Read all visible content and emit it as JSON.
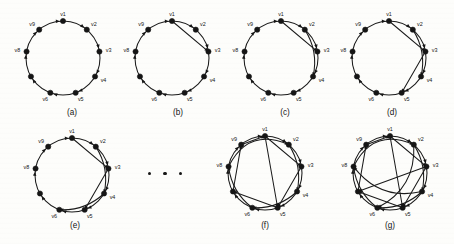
{
  "figure": {
    "background_color": "#fdfdfb",
    "ink_color": "#151515",
    "vertex_count": 9,
    "vertex_labels": [
      "v1",
      "v2",
      "v3",
      "v4",
      "v5",
      "v6",
      "v7",
      "v8",
      "v9"
    ],
    "visible_vertex_labels": [
      "v1",
      "v2",
      "v3",
      "v4",
      "v5",
      "v6",
      "v8",
      "v9"
    ],
    "ellipsis": {
      "name": "ellipsis-between-e-and-f",
      "dot_count": 3,
      "x": 148,
      "y": 172
    },
    "panels": [
      {
        "id": "a",
        "caption": "(a)",
        "caption_x": 72,
        "caption_y": 108,
        "cx": 63,
        "cy": 58,
        "r": 37,
        "chords": [],
        "outer_arcs": [],
        "labels_shown": [
          "v1",
          "v2",
          "v3",
          "v4",
          "v5",
          "v6",
          "v8",
          "v9"
        ]
      },
      {
        "id": "b",
        "caption": "(b)",
        "caption_x": 178,
        "caption_y": 108,
        "cx": 172,
        "cy": 58,
        "r": 37,
        "chords": [
          [
            1,
            3
          ]
        ],
        "outer_arcs": [],
        "labels_shown": [
          "v1",
          "v2",
          "v3",
          "v4",
          "v5",
          "v6",
          "v8",
          "v9"
        ]
      },
      {
        "id": "c",
        "caption": "(c)",
        "caption_x": 285,
        "caption_y": 108,
        "cx": 281,
        "cy": 58,
        "r": 37,
        "chords": [
          [
            1,
            3
          ]
        ],
        "outer_arcs": [
          [
            2,
            4
          ]
        ],
        "labels_shown": [
          "v1",
          "v2",
          "v3",
          "v4",
          "v5",
          "v6",
          "v8",
          "v9"
        ]
      },
      {
        "id": "d",
        "caption": "(d)",
        "caption_x": 392,
        "caption_y": 108,
        "cx": 389,
        "cy": 58,
        "r": 37,
        "chords": [
          [
            1,
            3
          ],
          [
            3,
            5
          ]
        ],
        "outer_arcs": [
          [
            2,
            4
          ]
        ],
        "labels_shown": [
          "v1",
          "v2",
          "v3",
          "v4",
          "v5",
          "v6",
          "v8",
          "v9"
        ]
      },
      {
        "id": "e",
        "caption": "(e)",
        "caption_x": 75,
        "caption_y": 221,
        "cx": 72,
        "cy": 175,
        "r": 37,
        "chords": [
          [
            1,
            3
          ],
          [
            3,
            5
          ]
        ],
        "outer_arcs": [
          [
            2,
            4
          ],
          [
            4,
            6
          ]
        ],
        "labels_shown": [
          "v1",
          "v2",
          "v3",
          "v4",
          "v5",
          "v6",
          "v8",
          "v9"
        ]
      },
      {
        "id": "f",
        "caption": "(f)",
        "caption_x": 265,
        "caption_y": 221,
        "cx": 265,
        "cy": 173,
        "r": 37,
        "chords": [
          [
            1,
            3
          ],
          [
            3,
            5
          ],
          [
            5,
            7
          ],
          [
            7,
            9
          ],
          [
            9,
            1
          ],
          [
            1,
            5
          ]
        ],
        "outer_arcs": [
          [
            2,
            4
          ],
          [
            4,
            6
          ],
          [
            6,
            8
          ],
          [
            8,
            2
          ]
        ],
        "labels_shown": [
          "v1",
          "v2",
          "v3",
          "v4",
          "v5",
          "v6",
          "v8",
          "v9"
        ]
      },
      {
        "id": "g",
        "caption": "(g)",
        "caption_x": 390,
        "caption_y": 221,
        "cx": 390,
        "cy": 173,
        "r": 37,
        "chords": [
          [
            1,
            3
          ],
          [
            3,
            5
          ],
          [
            5,
            7
          ],
          [
            7,
            9
          ],
          [
            9,
            1
          ],
          [
            1,
            5
          ],
          [
            3,
            7
          ]
        ],
        "outer_arcs": [
          [
            2,
            4
          ],
          [
            4,
            6
          ],
          [
            6,
            8
          ],
          [
            8,
            2
          ],
          [
            2,
            6
          ],
          [
            4,
            8
          ]
        ],
        "labels_shown": [
          "v1",
          "v2",
          "v3",
          "v4",
          "v5",
          "v6",
          "v8",
          "v9"
        ]
      }
    ]
  }
}
